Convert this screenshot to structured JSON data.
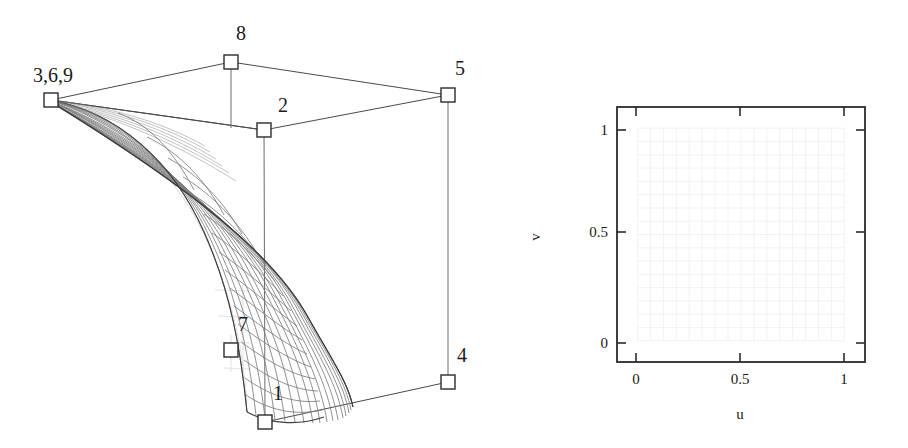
{
  "page": {
    "width": 908,
    "height": 448,
    "background": "#ffffff",
    "ink_color": "#2b2b2b",
    "mesh_color": "#7c7c7c",
    "grid_color": "#eceaea"
  },
  "left_figure": {
    "name": "bezier-surface-3d",
    "description": "Wireframe Bezier/NURBS surface patch with labelled control points and control polygon",
    "control_points": [
      {
        "id": "1",
        "label": "1",
        "x": 265,
        "y": 422,
        "label_x": 273,
        "label_y": 400
      },
      {
        "id": "2",
        "label": "2",
        "x": 264,
        "y": 130,
        "label_x": 278,
        "label_y": 112
      },
      {
        "id": "369",
        "label": "3,6,9",
        "x": 51,
        "y": 100,
        "label_x": 33,
        "label_y": 82
      },
      {
        "id": "4",
        "label": "4",
        "x": 448,
        "y": 382,
        "label_x": 457,
        "label_y": 362
      },
      {
        "id": "5",
        "label": "5",
        "x": 448,
        "y": 95,
        "label_x": 455,
        "label_y": 75
      },
      {
        "id": "7",
        "label": "7",
        "x": 231,
        "y": 350,
        "label_x": 238,
        "label_y": 331
      },
      {
        "id": "8",
        "label": "8",
        "x": 231,
        "y": 62,
        "label_x": 236,
        "label_y": 40
      }
    ],
    "control_polygon": [
      {
        "from": "369",
        "to": "8"
      },
      {
        "from": "8",
        "to": "5"
      },
      {
        "from": "5",
        "to": "2"
      },
      {
        "from": "2",
        "to": "369"
      },
      {
        "from": "1",
        "to": "4"
      }
    ],
    "vertical_stems": [
      {
        "from": "8",
        "to": "2"
      },
      {
        "from": "5",
        "to": "4"
      },
      {
        "from": "2",
        "to": "1"
      }
    ],
    "mesh": {
      "u_lines": 17,
      "v_lines": 17
    }
  },
  "right_figure": {
    "name": "uv-parameter-domain",
    "chart_data": {
      "type": "scatter",
      "title": "",
      "xlabel": "u",
      "ylabel": "v",
      "xlim": [
        -0.1,
        1.1
      ],
      "ylim": [
        -0.1,
        1.1
      ],
      "grid": true,
      "legend": null,
      "xticks": [
        0,
        0.5,
        1
      ],
      "xticklabels": [
        "0",
        "0.5",
        "1"
      ],
      "yticks": [
        0,
        0.5,
        1
      ],
      "yticklabels": [
        "0",
        "0.5",
        "1"
      ],
      "description": "Unit square parameter domain showing a faint isoparametric u-v mesh grid",
      "u_grid_count": 17,
      "v_grid_count": 17,
      "u_range": [
        0,
        1
      ],
      "v_range": [
        0,
        1
      ]
    },
    "axes_box_px": {
      "left": 617,
      "top": 107,
      "right": 865,
      "bottom": 362
    },
    "xlabel": "u",
    "ylabel": "v",
    "xticklabels": [
      "0",
      "0.5",
      "1"
    ],
    "yticklabels": [
      "0",
      "0.5",
      "1"
    ]
  }
}
